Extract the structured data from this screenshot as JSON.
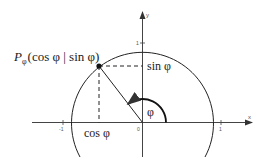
{
  "diagram": {
    "axes": {
      "x_label": "x",
      "y_label": "y",
      "ticks": {
        "x_neg": "-1",
        "origin": "0",
        "x_pos": "1",
        "y_pos": "1"
      }
    },
    "point_label": {
      "main": "P",
      "subscript": "φ",
      "coords": "(cos φ | sin φ)"
    },
    "sin_label": "sin φ",
    "cos_label": "cos φ",
    "angle_label": "φ",
    "colors": {
      "line": "#222222",
      "axis": "#444444",
      "tick_text": "#666666",
      "background": "#ffffff"
    }
  }
}
